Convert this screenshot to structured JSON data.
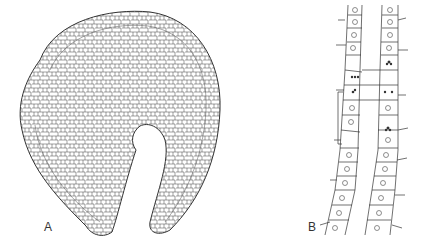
{
  "figure": {
    "panels": [
      {
        "id": "A",
        "label": "A",
        "description": "Cross-section of a curved cellular organ with a central keyhole-shaped lumen"
      },
      {
        "id": "B",
        "label": "B",
        "description": "Two diverging columns of cells with nuclei; some cells show dividing chromosomes"
      }
    ],
    "colors": {
      "stroke": "#333333",
      "background": "#ffffff"
    }
  }
}
